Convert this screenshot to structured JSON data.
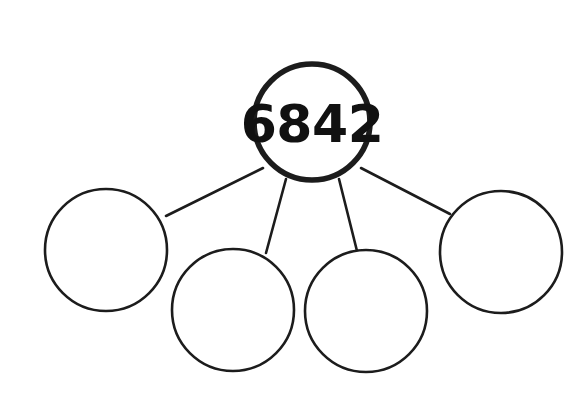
{
  "worksheet": {
    "title": "Place value number bond",
    "background_color": "#ffffff",
    "ink_color": "#1c1c1c",
    "width": 584,
    "height": 401
  },
  "diagram": {
    "type": "number-bond",
    "parent": {
      "id": "whole",
      "label": "whole-circle",
      "value": "6842",
      "filled": true,
      "cx": 312,
      "cy": 122,
      "r": 58,
      "stroke_width": 5.6
    },
    "children": [
      {
        "id": "part-1",
        "label": "part-circle-1",
        "value": "",
        "filled": false,
        "cx": 106,
        "cy": 250,
        "r": 61,
        "stroke_width": 2.6
      },
      {
        "id": "part-2",
        "label": "part-circle-2",
        "value": "",
        "filled": false,
        "cx": 233,
        "cy": 310,
        "r": 61,
        "stroke_width": 2.6
      },
      {
        "id": "part-3",
        "label": "part-circle-3",
        "value": "",
        "filled": false,
        "cx": 366,
        "cy": 311,
        "r": 61,
        "stroke_width": 2.6
      },
      {
        "id": "part-4",
        "label": "part-circle-4",
        "value": "",
        "filled": false,
        "cx": 501,
        "cy": 252,
        "r": 61,
        "stroke_width": 2.6
      }
    ],
    "connectors": [
      {
        "id": "link-1",
        "from": "whole",
        "to": "part-1",
        "x1": 263,
        "y1": 168,
        "x2": 166,
        "y2": 216
      },
      {
        "id": "link-2",
        "from": "whole",
        "to": "part-2",
        "x1": 286,
        "y1": 179,
        "x2": 266,
        "y2": 253
      },
      {
        "id": "link-3",
        "from": "whole",
        "to": "part-3",
        "x1": 339,
        "y1": 179,
        "x2": 357,
        "y2": 251
      },
      {
        "id": "link-4",
        "from": "whole",
        "to": "part-4",
        "x1": 361,
        "y1": 168,
        "x2": 450,
        "y2": 214
      }
    ]
  }
}
